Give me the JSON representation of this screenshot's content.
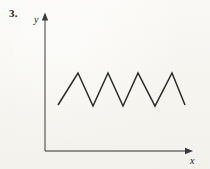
{
  "figure": {
    "problem_number": "3.",
    "axes": {
      "y_label": "y",
      "x_label": "x",
      "origin": {
        "x": 45,
        "y": 151
      },
      "y_axis_top": 14,
      "x_axis_right": 192,
      "arrowheads": true
    },
    "colors": {
      "ink": "#2b2b2b",
      "axis": "#6f6f6f",
      "number": "#1c1c1c",
      "paper": "#f7f6f2"
    }
  },
  "chart_data": {
    "type": "line",
    "title": "",
    "subtitle": "",
    "xlabel": "x",
    "ylabel": "y",
    "grid": false,
    "legend": null,
    "xlim": [
      45,
      192
    ],
    "ylim": [
      151,
      14
    ],
    "series": [
      {
        "name": "zigzag",
        "points": [
          {
            "x": 58,
            "y": 105
          },
          {
            "x": 78,
            "y": 73
          },
          {
            "x": 93,
            "y": 106
          },
          {
            "x": 108,
            "y": 73
          },
          {
            "x": 123,
            "y": 106
          },
          {
            "x": 138,
            "y": 73
          },
          {
            "x": 155,
            "y": 106
          },
          {
            "x": 172,
            "y": 73
          },
          {
            "x": 185,
            "y": 105
          }
        ]
      }
    ],
    "peaks": [
      {
        "x": 78,
        "y": 73
      },
      {
        "x": 108,
        "y": 73
      },
      {
        "x": 138,
        "y": 73
      },
      {
        "x": 172,
        "y": 73
      }
    ],
    "valleys": [
      {
        "x": 93,
        "y": 106
      },
      {
        "x": 123,
        "y": 106
      },
      {
        "x": 155,
        "y": 106
      }
    ]
  }
}
